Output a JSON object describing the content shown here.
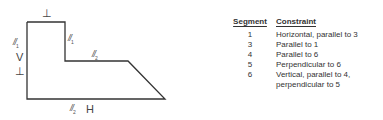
{
  "figure": {
    "labels": {
      "top_perp": "⊥",
      "left_par": "//",
      "left_par_sub": "1",
      "left_v": "V",
      "left_perp": "⊥",
      "inner_par": "//",
      "inner_par_sub": "1",
      "mid_par": "//",
      "mid_par_sub": "2",
      "bottom_par": "//",
      "bottom_par_sub": "2",
      "bottom_h": "H"
    },
    "stroke_color": "#333333"
  },
  "table": {
    "headers": {
      "segment": "Segment",
      "constraint": "Constraint"
    },
    "rows": [
      {
        "segment": "1",
        "constraint": "Horizontal, parallel to 3"
      },
      {
        "segment": "3",
        "constraint": "Parallel to 1"
      },
      {
        "segment": "4",
        "constraint": "Parallel to 6"
      },
      {
        "segment": "5",
        "constraint": "Perpendicular to 6"
      },
      {
        "segment": "6",
        "constraint": "Vertical, parallel to 4,"
      },
      {
        "segment": "",
        "constraint": "perpendicular to 5"
      }
    ]
  }
}
